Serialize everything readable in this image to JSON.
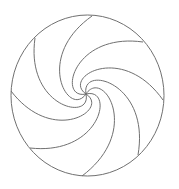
{
  "diagram": {
    "type": "spiral-swirl",
    "canvas": {
      "width": 179,
      "height": 189,
      "background": "#ffffff"
    },
    "circle": {
      "cx": 87.5,
      "cy": 95.5,
      "rx": 76.5,
      "ry": 80.5
    },
    "center": {
      "x": 86,
      "y": 94
    },
    "arm_count": 8,
    "arm_endpoints": [
      {
        "x": 92,
        "y": 16
      },
      {
        "x": 143,
        "y": 42
      },
      {
        "x": 163,
        "y": 100
      },
      {
        "x": 138,
        "y": 155
      },
      {
        "x": 82,
        "y": 176
      },
      {
        "x": 30,
        "y": 148
      },
      {
        "x": 11,
        "y": 91
      },
      {
        "x": 35,
        "y": 38
      }
    ],
    "stroke_color": "#707070",
    "stroke_width": 1
  }
}
